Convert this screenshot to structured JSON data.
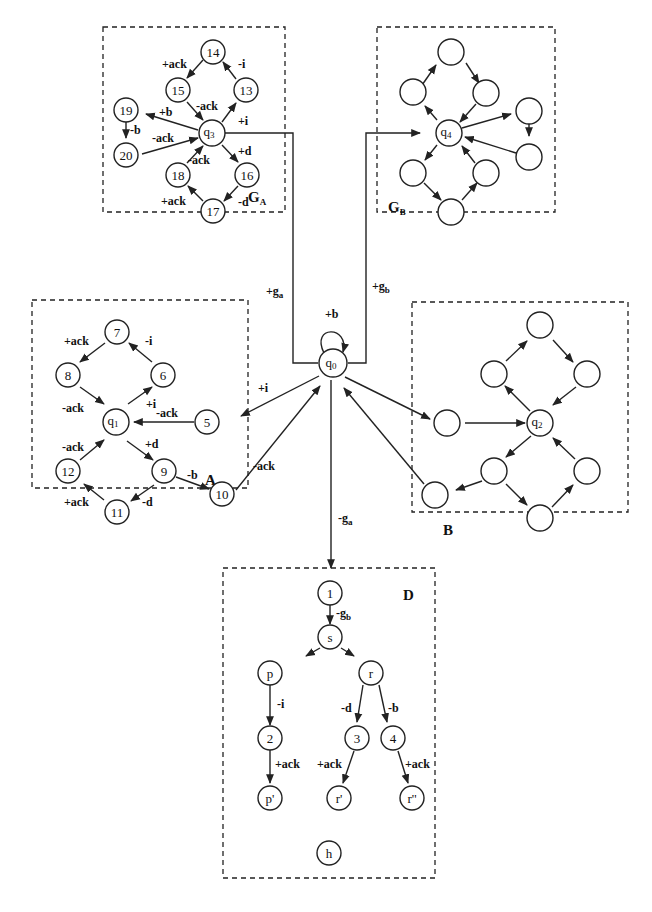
{
  "diagram": {
    "type": "state-transition-diagram",
    "boxes": {
      "GA": {
        "label": "G",
        "sub": "A"
      },
      "GB": {
        "label": "G",
        "sub": "B"
      },
      "A": {
        "label": "A"
      },
      "B": {
        "label": "B"
      },
      "D": {
        "label": "D"
      }
    },
    "nodes": {
      "q0": {
        "label": "q",
        "sub": "0"
      },
      "q1": {
        "label": "q",
        "sub": "1"
      },
      "q2": {
        "label": "q",
        "sub": "2"
      },
      "q3": {
        "label": "q",
        "sub": "3"
      },
      "q4": {
        "label": "q",
        "sub": "4"
      },
      "n1": "1",
      "n2": "2",
      "n3": "3",
      "n4": "4",
      "n5": "5",
      "n6": "6",
      "n7": "7",
      "n8": "8",
      "n9": "9",
      "n10": "10",
      "n11": "11",
      "n12": "12",
      "n13": "13",
      "n14": "14",
      "n15": "15",
      "n16": "16",
      "n17": "17",
      "n18": "18",
      "n19": "19",
      "n20": "20",
      "s": "s",
      "p": "p",
      "r": "r",
      "p_prime": "p'",
      "r_prime": "r'",
      "r_dprime": "r''",
      "h": "h"
    },
    "edge_labels": {
      "q0_self": "+b",
      "to_GA": {
        "text": "+g",
        "sub": "a"
      },
      "to_GB": {
        "text": "+g",
        "sub": "b"
      },
      "q0_to_5": "+i",
      "10_to_q0": "-ack",
      "q0_to_D": {
        "text": "-g",
        "sub": "a"
      },
      "A_7_8": "+ack",
      "A_6_7": "-i",
      "A_8_q1": "-ack",
      "A_q1_6": "+i",
      "A_5_q1": "-ack",
      "A_12_q1": "-ack",
      "A_q1_9": "+d",
      "A_9_10": "-b",
      "A_11_12": "+ack",
      "A_9_11": "-d",
      "GA_14_15": "+ack",
      "GA_13_14": "-i",
      "GA_15_q3": "-ack",
      "GA_q3_13": "+i",
      "GA_q3_19": "+b",
      "GA_19_20": "-b",
      "GA_20_q3": "-ack",
      "GA_18_q3": "-ack",
      "GA_q3_16": "+d",
      "GA_16_17": "-d",
      "GA_17_18": "+ack",
      "D_1_s": {
        "text": "-g",
        "sub": "b"
      },
      "D_p_2": "-i",
      "D_r_3": "-d",
      "D_r_4": "-b",
      "D_2_pp": "+ack",
      "D_3_rp": "+ack",
      "D_4_rpp": "+ack"
    }
  }
}
